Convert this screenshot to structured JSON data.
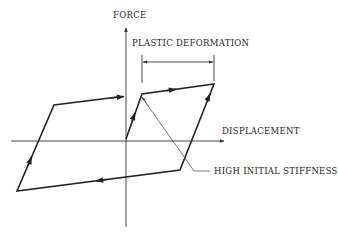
{
  "diagram": {
    "type": "hysteresis-loop",
    "labels": {
      "y_axis": "FORCE",
      "x_axis": "DISPLACEMENT",
      "dimension": "PLASTIC DEFORMATION",
      "callout": "HIGH INITIAL STIFFNESS"
    },
    "colors": {
      "line": "#222222",
      "axis": "#333333",
      "leader": "#555555",
      "background": "#ffffff"
    },
    "loop_path": [
      {
        "x": 126,
        "y": 139,
        "note": "origin"
      },
      {
        "x": 142,
        "y": 94,
        "note": "initial yield"
      },
      {
        "x": 214,
        "y": 84,
        "note": "max positive displacement"
      },
      {
        "x": 180,
        "y": 170,
        "note": "unload / reverse yield"
      },
      {
        "x": 17,
        "y": 191,
        "note": "max negative displacement"
      },
      {
        "x": 54,
        "y": 105,
        "note": "reload yield"
      },
      {
        "x": 124,
        "y": 97,
        "note": "arrow continuation"
      }
    ]
  }
}
